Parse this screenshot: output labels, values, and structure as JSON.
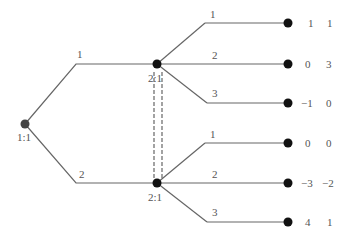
{
  "root": {
    "label": "1:1",
    "x": 25,
    "y": 124
  },
  "p1": {
    "edge1": "1",
    "edge2": "2"
  },
  "upper": {
    "label": "2:1",
    "x": 157,
    "y": 64
  },
  "lower": {
    "label": "2:1",
    "x": 157,
    "y": 183
  },
  "actions": [
    "1",
    "2",
    "3"
  ],
  "payoffs_upper": [
    [
      "1",
      "1"
    ],
    [
      "0",
      "3"
    ],
    [
      "−1",
      "0"
    ]
  ],
  "payoffs_lower": [
    [
      "0",
      "0"
    ],
    [
      "−3",
      "−2"
    ],
    [
      "4",
      "1"
    ]
  ]
}
